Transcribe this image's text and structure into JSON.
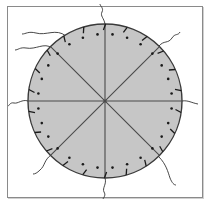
{
  "diagram": {
    "title": "",
    "description": "Circular disc divided into eight equal sectors by four diameters, with a ring of dots inside the rim, short tick marks on the rim, and wavy threads extending outward from the rim",
    "colors": {
      "background": "#ffffff",
      "frame": "#8a8a8a",
      "disc_fill": "#c6c6c6",
      "disc_stroke": "#3a3a3a",
      "spoke": "#4a4a4a",
      "dot": "#1a1a1a",
      "tick": "#1a1a1a",
      "thread": "#333333"
    },
    "circle": {
      "cx": 105,
      "cy": 101,
      "r": 77
    },
    "sectors": 8,
    "spoke_angles_deg": [
      0,
      45,
      90,
      135
    ],
    "dot_ring_radius": 67,
    "dot_count": 28,
    "tick_count": 22,
    "threads": [
      {
        "name": "thread-top",
        "d": "M105,24 C104,18 100,16 102,12 C104,8 100,6 100,4"
      },
      {
        "name": "thread-top-left-upper",
        "d": "M66,36 C56,28 46,36 36,33 C28,31 26,34 22,34"
      },
      {
        "name": "thread-top-left-lower",
        "d": "M52,48 C44,42 36,50 26,48 C20,47 18,50 15,50"
      },
      {
        "name": "thread-top-right",
        "d": "M159,46 C164,40 168,44 172,38 C175,33 178,36 180,32"
      },
      {
        "name": "thread-left",
        "d": "M28,101 C22,99 18,104 14,103 C10,102 9,106 8,106"
      },
      {
        "name": "thread-right",
        "d": "M182,101 C188,100 192,103 198,104"
      },
      {
        "name": "thread-bottom-left",
        "d": "M51,155 C44,160 45,166 40,170 C37,173 35,174 33,174"
      },
      {
        "name": "thread-bottom-right",
        "d": "M159,157 C166,164 168,172 170,178 C172,183 174,185 176,185"
      },
      {
        "name": "thread-bottom",
        "d": "M105,178 C107,184 102,188 104,192 C106,195 104,197 103,199"
      }
    ]
  }
}
